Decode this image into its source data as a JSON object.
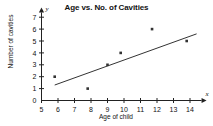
{
  "chart_data": {
    "type": "scatter",
    "title": "Age vs. No. of Cavities",
    "xlabel": "Age of child",
    "ylabel": "Number of cavities",
    "x_axis_letter": "x",
    "y_axis_letter": "y",
    "xlim": [
      5,
      14.7
    ],
    "ylim": [
      0,
      7.4
    ],
    "x_ticks": [
      5,
      6,
      7,
      8,
      9,
      10,
      11,
      12,
      13,
      14
    ],
    "y_ticks": [
      0,
      1,
      2,
      3,
      4,
      5,
      6,
      7
    ],
    "x_tick_labels": [
      "5",
      "6",
      "7",
      "8",
      "9",
      "10",
      "11",
      "12",
      "13",
      "14"
    ],
    "y_tick_labels": [
      "0",
      "1",
      "2",
      "3",
      "4",
      "5",
      "6",
      "7"
    ],
    "grid": false,
    "legend": false,
    "marker_color": "#333333",
    "line_color": "#333333",
    "axis_color": "#222222",
    "points": [
      {
        "x": 5.8,
        "y": 2
      },
      {
        "x": 7.8,
        "y": 1
      },
      {
        "x": 9.0,
        "y": 3
      },
      {
        "x": 9.8,
        "y": 4
      },
      {
        "x": 11.7,
        "y": 6
      },
      {
        "x": 13.8,
        "y": 5
      }
    ],
    "trend_line": {
      "x_start": 5.8,
      "y_start": 1.3,
      "x_end": 14.4,
      "y_end": 5.6
    }
  }
}
